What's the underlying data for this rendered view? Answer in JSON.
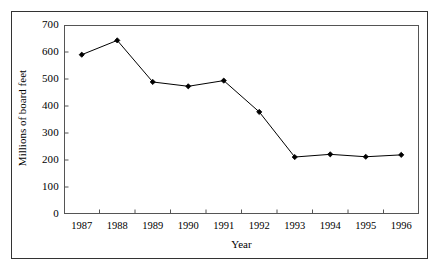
{
  "chart_data": {
    "type": "line",
    "title": "",
    "xlabel": "Year",
    "ylabel": "Millions of board feet",
    "categories": [
      "1987",
      "1988",
      "1989",
      "1990",
      "1991",
      "1992",
      "1993",
      "1994",
      "1995",
      "1996"
    ],
    "values": [
      590,
      643,
      489,
      473,
      494,
      378,
      211,
      221,
      212,
      219
    ],
    "series": [
      {
        "name": "Millions of board feet",
        "values": [
          590,
          643,
          489,
          473,
          494,
          378,
          211,
          221,
          212,
          219
        ]
      }
    ],
    "ylim": [
      0,
      700
    ],
    "yticks": [
      0,
      100,
      200,
      300,
      400,
      500,
      600,
      700
    ],
    "ytick_labels": [
      "0",
      "100",
      "200",
      "300",
      "400",
      "500",
      "600",
      "700"
    ],
    "grid": false,
    "legend": "none",
    "marker": "filled-diamond",
    "line_color": "#000000",
    "marker_color": "#000000",
    "background_color": "#ffffff",
    "frame_color": "#555555"
  }
}
